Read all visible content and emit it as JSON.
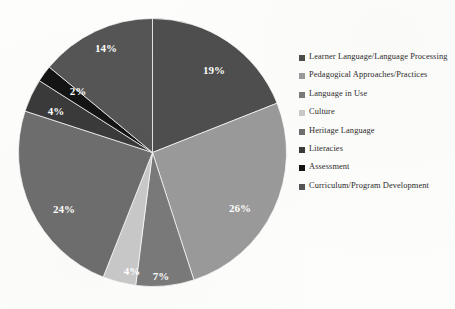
{
  "chart_data": {
    "type": "pie",
    "title": "",
    "xlabel": "",
    "ylabel": "",
    "legend_position": "right",
    "grid": false,
    "unit": "%",
    "categories": [
      "Learner Language/Language Processing",
      "Pedagogical Approaches/Practices",
      "Language in Use",
      "Culture",
      "Heritage Language",
      "Literacies",
      "Assessment",
      "Curriculum/Program Development"
    ],
    "values": [
      19,
      26,
      7,
      4,
      24,
      4,
      2,
      14
    ],
    "data_labels": [
      "19%",
      "26%",
      "7%",
      "4%",
      "24%",
      "4%",
      "2%",
      "14%"
    ],
    "colors": [
      "#4e4e4e",
      "#9a9a9a",
      "#7a7a7a",
      "#c9c9c9",
      "#6e6e6e",
      "#3a3a3a",
      "#141414",
      "#555555"
    ]
  },
  "chart": {
    "slices": [
      {
        "label": "Learner Language/Language Processing",
        "value": 19,
        "display": "19%",
        "color": "#4e4e4e",
        "label_x": 196,
        "label_y": 56
      },
      {
        "label": "Pedagogical Approaches/Practices",
        "value": 26,
        "display": "26%",
        "color": "#9a9a9a",
        "label_x": 222,
        "label_y": 194
      },
      {
        "label": "Language in Use",
        "value": 7,
        "display": "7%",
        "color": "#7a7a7a",
        "label_x": 143,
        "label_y": 262
      },
      {
        "label": "Culture",
        "value": 4,
        "display": "4%",
        "color": "#c9c9c9",
        "label_x": 114,
        "label_y": 257
      },
      {
        "label": "Heritage Language",
        "value": 24,
        "display": "24%",
        "color": "#6e6e6e",
        "label_x": 46,
        "label_y": 195
      },
      {
        "label": "Literacies",
        "value": 4,
        "display": "4%",
        "color": "#3a3a3a",
        "label_x": 38,
        "label_y": 97
      },
      {
        "label": "Assessment",
        "value": 2,
        "display": "2%",
        "color": "#141414",
        "label_x": 60,
        "label_y": 77
      },
      {
        "label": "Curriculum/Program Development",
        "value": 14,
        "display": "14%",
        "color": "#555555",
        "label_x": 88,
        "label_y": 34
      }
    ]
  },
  "legend": {
    "items": [
      {
        "label": "Learner Language/Language Processing",
        "color": "#4e4e4e"
      },
      {
        "label": "Pedagogical Approaches/Practices",
        "color": "#9a9a9a"
      },
      {
        "label": "Language in Use",
        "color": "#7a7a7a"
      },
      {
        "label": "Culture",
        "color": "#c9c9c9"
      },
      {
        "label": "Heritage Language",
        "color": "#6e6e6e"
      },
      {
        "label": "Literacies",
        "color": "#3a3a3a"
      },
      {
        "label": "Assessment",
        "color": "#141414"
      },
      {
        "label": "Curriculum/Program Development",
        "color": "#555555"
      }
    ]
  }
}
